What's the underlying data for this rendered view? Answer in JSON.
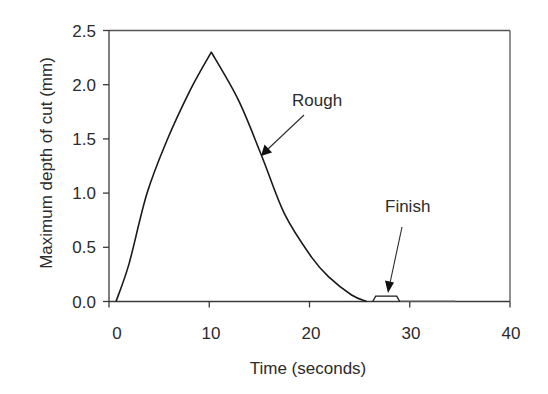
{
  "chart_data": {
    "type": "line",
    "title": "",
    "xlabel": "Time (seconds)",
    "ylabel": "Maximum depth of cut (mm)",
    "xlim": [
      0,
      40
    ],
    "ylim": [
      0,
      2.5
    ],
    "x_ticks": [
      0,
      10,
      20,
      30,
      40
    ],
    "x_tick_labels": [
      "0",
      "10",
      "20",
      "30",
      "40"
    ],
    "y_ticks": [
      0,
      0.5,
      1.0,
      1.5,
      2.0,
      2.5
    ],
    "y_tick_labels": [
      "0.0",
      "0.5",
      "1.0",
      "1.5",
      "2.0",
      "2.5"
    ],
    "grid": false,
    "legend": null,
    "series": [
      {
        "name": "Rough",
        "x": [
          0.7,
          2.0,
          3.8,
          5.8,
          8.1,
          10.2,
          12.9,
          15.2,
          17.5,
          20.2,
          22.0,
          24.2,
          25.7
        ],
        "y": [
          0.0,
          0.35,
          1.0,
          1.49,
          1.95,
          2.3,
          1.86,
          1.35,
          0.81,
          0.41,
          0.22,
          0.06,
          0.0
        ]
      },
      {
        "name": "Finish",
        "x": [
          26.3,
          26.6,
          28.7,
          29.0,
          34.5
        ],
        "y": [
          0.0,
          0.05,
          0.05,
          0.0,
          0.0
        ]
      }
    ],
    "annotations": [
      {
        "text": "Rough",
        "arrow_to": {
          "x": 15.2,
          "y": 1.35
        }
      },
      {
        "text": "Finish",
        "arrow_to": {
          "x": 27.8,
          "y": 0.08
        }
      }
    ]
  },
  "labels": {
    "xlabel": "Time (seconds)",
    "ylabel": "Maximum depth of cut (mm)",
    "rough": "Rough",
    "finish": "Finish",
    "x_ticks": [
      "0",
      "10",
      "20",
      "30",
      "40"
    ],
    "y_ticks": [
      "0.0",
      "0.5",
      "1.0",
      "1.5",
      "2.0",
      "2.5"
    ]
  }
}
